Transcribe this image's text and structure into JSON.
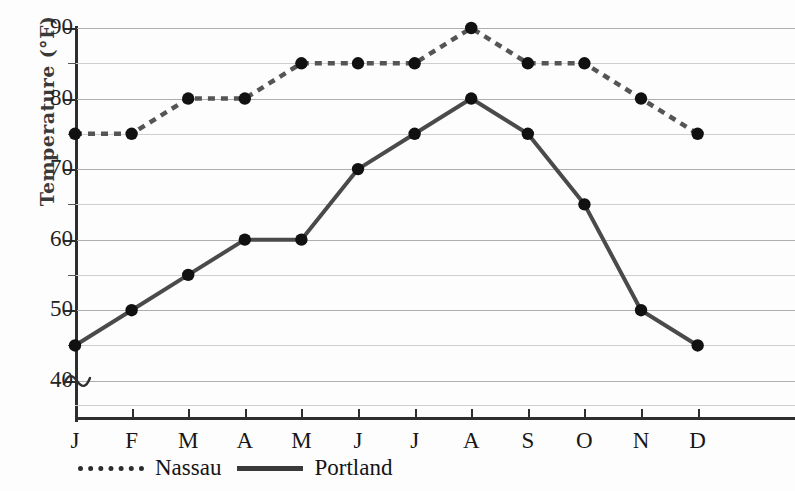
{
  "chart_data": {
    "type": "line",
    "title": "",
    "xlabel": "",
    "ylabel": "Temperature (°F)",
    "categories": [
      "J",
      "F",
      "M",
      "A",
      "M",
      "J",
      "J",
      "A",
      "S",
      "O",
      "N",
      "D"
    ],
    "ytick_labels": [
      "90",
      "80",
      "70",
      "60",
      "50",
      "40"
    ],
    "ytick_values": [
      90,
      80,
      70,
      60,
      50,
      40
    ],
    "ylim": [
      35,
      90
    ],
    "y_axis_break": true,
    "y_minor_step": 5,
    "grid": true,
    "legend_position": "bottom-left",
    "series": [
      {
        "name": "Nassau",
        "style": "dotted",
        "values": [
          75,
          75,
          80,
          80,
          85,
          85,
          85,
          90,
          85,
          85,
          80,
          75
        ]
      },
      {
        "name": "Portland",
        "style": "solid",
        "values": [
          45,
          50,
          55,
          60,
          60,
          70,
          75,
          80,
          75,
          65,
          50,
          45
        ]
      }
    ]
  },
  "legend": {
    "items": [
      {
        "label": "Nassau",
        "style": "dotted"
      },
      {
        "label": "Portland",
        "style": "solid"
      }
    ]
  },
  "colors": {
    "gridline": "#aeaeae",
    "axis": "#2e2e2e",
    "series_nassau": "#555555",
    "series_portland": "#4a4a4a",
    "marker": "#111111",
    "background": "#fdfdfd"
  }
}
